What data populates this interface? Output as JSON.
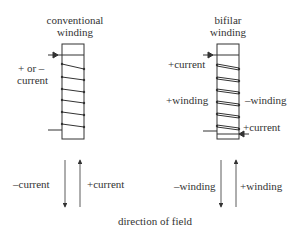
{
  "conventional": {
    "title_line1": "conventional",
    "title_line2": "winding",
    "side_label_line1": "+ or –",
    "side_label_line2": "current",
    "arrow_down_label": "–current",
    "arrow_up_label": "+current"
  },
  "bifilar": {
    "title_line1": "bifilar",
    "title_line2": "winding",
    "top_current_label": "+current",
    "left_winding_label": "+winding",
    "right_winding_label": "–winding",
    "bottom_current_label": "+current",
    "arrow_down_label": "–winding",
    "arrow_up_label": "+winding"
  },
  "caption": "direction of field",
  "colors": {
    "line": "#333333",
    "background": "#ffffff"
  }
}
